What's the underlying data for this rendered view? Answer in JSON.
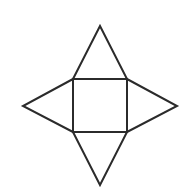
{
  "figure": {
    "name": "square-pyramid-net",
    "background_color": "#ffffff",
    "stroke_color": "#2b2b2b",
    "stroke_width": 2,
    "fill_color": "none",
    "canvas": {
      "width": 196,
      "height": 192
    },
    "labels": [],
    "shapes": [
      {
        "id": "center-square",
        "name": "center-square",
        "type": "square",
        "points": "73,79 127,79 127,132 73,132",
        "side_length": 54
      },
      {
        "id": "top-triangle",
        "name": "top-triangle",
        "type": "isosceles-triangle",
        "points": "73,79 100,26 127,79",
        "apex": "100,26",
        "base": "73,79 127,79"
      },
      {
        "id": "right-triangle",
        "name": "right-triangle",
        "type": "isosceles-triangle",
        "points": "127,79 177,106 127,132",
        "apex": "177,106",
        "base": "127,79 127,132"
      },
      {
        "id": "bottom-triangle",
        "name": "bottom-triangle",
        "type": "isosceles-triangle",
        "points": "73,132 100,185 127,132",
        "apex": "100,185",
        "base": "73,132 127,132"
      },
      {
        "id": "left-triangle",
        "name": "left-triangle",
        "type": "isosceles-triangle",
        "points": "73,79 23,106 73,132",
        "apex": "23,106",
        "base": "73,79 73,132"
      }
    ]
  }
}
